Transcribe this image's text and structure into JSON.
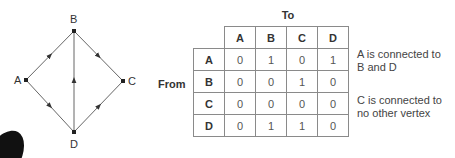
{
  "graph": {
    "vertices": [
      {
        "id": "A",
        "label": "A",
        "x": 26,
        "y": 80
      },
      {
        "id": "B",
        "label": "B",
        "x": 74,
        "y": 31
      },
      {
        "id": "C",
        "label": "C",
        "x": 123,
        "y": 81
      },
      {
        "id": "D",
        "label": "D",
        "x": 74,
        "y": 132
      }
    ],
    "edges": [
      {
        "from": "A",
        "to": "B"
      },
      {
        "from": "A",
        "to": "D"
      },
      {
        "from": "B",
        "to": "C"
      },
      {
        "from": "D",
        "to": "B"
      },
      {
        "from": "D",
        "to": "C"
      }
    ],
    "edge_color": "#555555"
  },
  "matrix": {
    "col_axis_label": "To",
    "row_axis_label": "From",
    "columns": [
      "A",
      "B",
      "C",
      "D"
    ],
    "rows": [
      {
        "label": "A",
        "values": [
          "0",
          "1",
          "0",
          "1"
        ]
      },
      {
        "label": "B",
        "values": [
          "0",
          "0",
          "1",
          "0"
        ]
      },
      {
        "label": "C",
        "values": [
          "0",
          "0",
          "0",
          "0"
        ]
      },
      {
        "label": "D",
        "values": [
          "0",
          "1",
          "1",
          "0"
        ]
      }
    ]
  },
  "notes": [
    {
      "line1": "A is connected to",
      "line2": "B and D"
    },
    {
      "line1": "C is connected to",
      "line2": "no other vertex"
    }
  ]
}
